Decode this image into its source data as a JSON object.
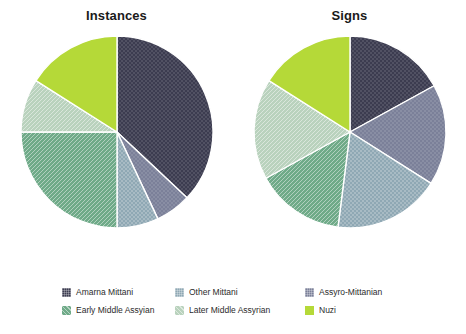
{
  "figure": {
    "background": "#ffffff",
    "panels": [
      {
        "title": "Instances",
        "key": "instances"
      },
      {
        "title": "Signs",
        "key": "signs"
      }
    ]
  },
  "legend": {
    "columns": 3,
    "rows": 2,
    "order": [
      "Amarna Mittani",
      "Other Mittani",
      "Assyro-Mittanian",
      "Early Middle Assyian",
      "Later Middle Assyrian",
      "Nuzi"
    ],
    "entries": [
      {
        "label": "Amarna Mittani",
        "color": "#3c3c50",
        "pattern": "dots",
        "row": 0,
        "col": 0
      },
      {
        "label": "Other Mittani",
        "color": "#8fa8b4",
        "pattern": "check",
        "row": 0,
        "col": 1
      },
      {
        "label": "Assyro-Mittanian",
        "color": "#7b8099",
        "pattern": "dots",
        "row": 0,
        "col": 2
      },
      {
        "label": "Early Middle Assyian",
        "color": "#6faa88",
        "pattern": "hatch",
        "row": 1,
        "col": 0
      },
      {
        "label": "Later Middle Assyrian",
        "color": "#b9d2bd",
        "pattern": "hatch",
        "row": 1,
        "col": 1
      },
      {
        "label": "Nuzi",
        "color": "#b5d938",
        "pattern": "solid",
        "row": 1,
        "col": 2
      }
    ]
  },
  "chart_data": [
    {
      "type": "pie",
      "title": "Instances",
      "start_angle_deg": 0,
      "direction": "clockwise",
      "grid": false,
      "legend_position": "bottom",
      "categories": [
        "Amarna Mittani",
        "Assyro-Mittanian",
        "Other Mittani",
        "Early Middle Assyian",
        "Later Middle Assyrian",
        "Nuzi"
      ],
      "values": [
        37,
        6,
        7,
        25,
        9,
        16
      ],
      "unit": "percent",
      "colors": [
        "#3c3c50",
        "#7b8099",
        "#8fa8b4",
        "#6faa88",
        "#b9d2bd",
        "#b5d938"
      ],
      "patterns": [
        "dots",
        "dots",
        "check",
        "hatch",
        "hatch",
        "solid"
      ]
    },
    {
      "type": "pie",
      "title": "Signs",
      "start_angle_deg": 0,
      "direction": "clockwise",
      "grid": false,
      "legend_position": "bottom",
      "categories": [
        "Amarna Mittani",
        "Assyro-Mittanian",
        "Other Mittani",
        "Early Middle Assyian",
        "Later Middle Assyrian",
        "Nuzi"
      ],
      "values": [
        17,
        17,
        18,
        15,
        17,
        16
      ],
      "unit": "percent",
      "colors": [
        "#3c3c50",
        "#7b8099",
        "#8fa8b4",
        "#6faa88",
        "#b9d2bd",
        "#b5d938"
      ],
      "patterns": [
        "dots",
        "dots",
        "check",
        "hatch",
        "hatch",
        "solid"
      ]
    }
  ]
}
